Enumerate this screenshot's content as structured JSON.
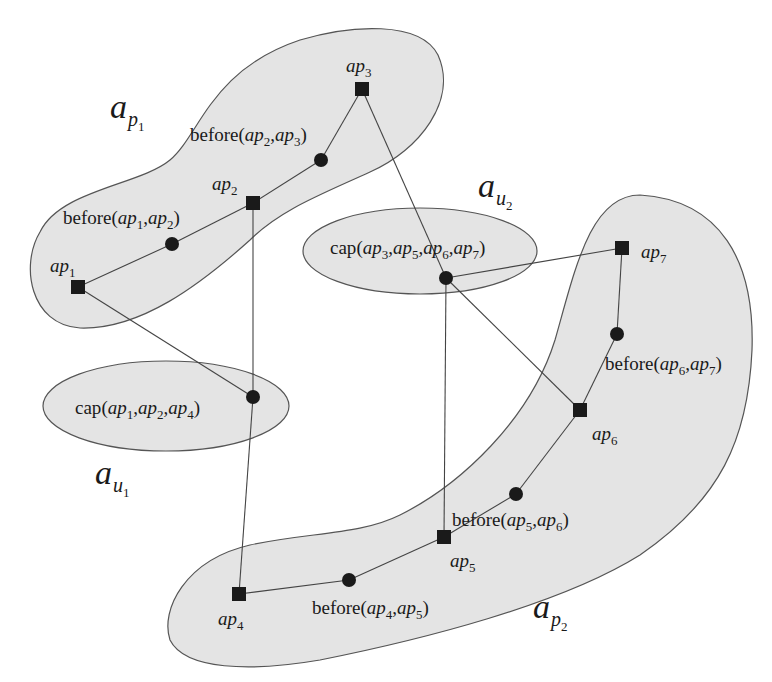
{
  "regions": {
    "ap1": {
      "name": "a",
      "sub": "p",
      "subsub": "1"
    },
    "ap2": {
      "name": "a",
      "sub": "p",
      "subsub": "2"
    },
    "au1": {
      "name": "a",
      "sub": "u",
      "subsub": "1"
    },
    "au2": {
      "name": "a",
      "sub": "u",
      "subsub": "2"
    }
  },
  "nodes": {
    "ap1": {
      "base": "ap",
      "idx": "1"
    },
    "ap2": {
      "base": "ap",
      "idx": "2"
    },
    "ap3": {
      "base": "ap",
      "idx": "3"
    },
    "ap4": {
      "base": "ap",
      "idx": "4"
    },
    "ap5": {
      "base": "ap",
      "idx": "5"
    },
    "ap6": {
      "base": "ap",
      "idx": "6"
    },
    "ap7": {
      "base": "ap",
      "idx": "7"
    }
  },
  "constraints": {
    "before_12": {
      "fn": "before",
      "args": [
        "1",
        "2"
      ]
    },
    "before_23": {
      "fn": "before",
      "args": [
        "2",
        "3"
      ]
    },
    "before_45": {
      "fn": "before",
      "args": [
        "4",
        "5"
      ]
    },
    "before_56": {
      "fn": "before",
      "args": [
        "5",
        "6"
      ]
    },
    "before_67": {
      "fn": "before",
      "args": [
        "6",
        "7"
      ]
    },
    "cap_124": {
      "fn": "cap",
      "args": [
        "1",
        "2",
        "4"
      ]
    },
    "cap_3567": {
      "fn": "cap",
      "args": [
        "3",
        "5",
        "6",
        "7"
      ]
    }
  },
  "text": {
    "ap": "ap",
    "open": "(",
    "close": ")",
    "comma": ","
  },
  "colors": {
    "region_fill": "#e4e4e4",
    "node": "#1a1a1a",
    "edge": "#444444"
  }
}
